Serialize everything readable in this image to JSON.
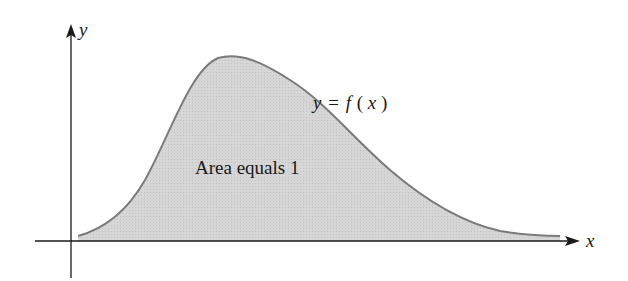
{
  "figure": {
    "type": "probability density curve",
    "axes": {
      "x_label": "x",
      "y_label": "y"
    },
    "curve_label": {
      "y": "y",
      "eq": "=",
      "f": "f",
      "open": "(",
      "x": "x",
      "close": ")"
    },
    "area_label": "Area equals 1",
    "colors": {
      "fill": "#d4d4d4",
      "curve": "#7a7a7a",
      "axis": "#1a1a1a",
      "text": "#1a1a1a"
    }
  }
}
